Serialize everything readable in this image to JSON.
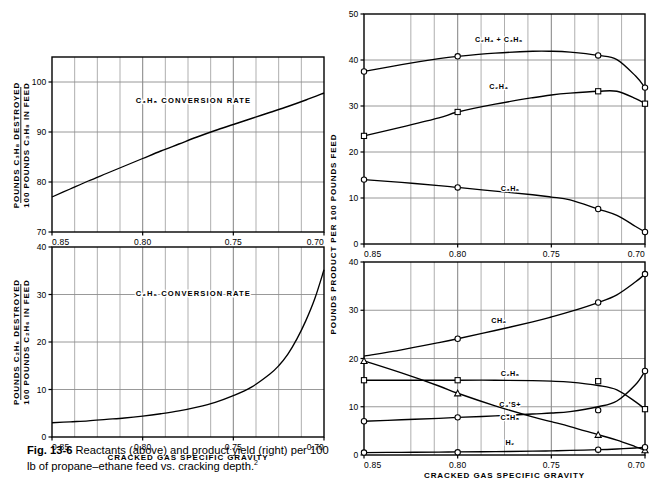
{
  "figure": {
    "caption_label": "Fig. 13-6",
    "caption_text": "Reactants (above) and product yield (right) per 100 lb of propane–ethane feed vs. cracking depth.",
    "caption_footnote_marker": "2",
    "xlabel": "CRACKED GAS SPECIFIC GRAVITY",
    "left_ylabel_line1": "POUNDS C₃H₈ DESTROYED",
    "left_ylabel_line2": "100 POUNDS C₃H₈ IN FEED",
    "left_ylabel2_line1": "POUNDS C₂H₆ DESTROYED",
    "left_ylabel2_line2": "100 POUNDS C₂H₆ IN FEED",
    "right_ylabel": "POUNDS PRODUCT PER 100 POUNDS FEED",
    "line_color": "#000000",
    "grid_color": "#8d8d8d",
    "background": "#ffffff"
  },
  "chart_data": [
    {
      "id": "propane-conversion",
      "type": "line",
      "title": "C₃H₈ CONVERSION RATE",
      "xlabel": "",
      "ylabel": "POUNDS C₃H₈ DESTROYED / 100 POUNDS C₃H₈ IN FEED",
      "xlim": [
        0.85,
        0.7
      ],
      "ylim": [
        70,
        105
      ],
      "xticks": [
        0.85,
        0.8,
        0.75,
        0.7
      ],
      "xticklabels": [
        "0.85",
        "0.80",
        "0.75",
        "0.70"
      ],
      "yticks": [
        70,
        80,
        90,
        100
      ],
      "yticklabels": [
        "70",
        "80",
        "90",
        "100"
      ],
      "xgrid_minor": [
        0.8375,
        0.825,
        0.8125,
        0.7875,
        0.775,
        0.7625,
        0.7375,
        0.725,
        0.7125
      ],
      "grid": true,
      "legend": "none",
      "x": [
        0.85,
        0.84,
        0.83,
        0.82,
        0.81,
        0.8,
        0.79,
        0.78,
        0.77,
        0.76,
        0.75,
        0.74,
        0.73,
        0.72,
        0.71,
        0.7
      ],
      "values": [
        77.0,
        78.6,
        80.2,
        81.7,
        83.2,
        84.7,
        86.2,
        87.6,
        89.0,
        90.3,
        91.5,
        92.7,
        93.9,
        95.1,
        96.4,
        97.8
      ]
    },
    {
      "id": "ethane-conversion",
      "type": "line",
      "title": "C₂H₆ CONVERSION RATE",
      "xlabel": "CRACKED GAS SPECIFIC GRAVITY",
      "ylabel": "POUNDS C₂H₆ DESTROYED / 100 POUNDS C₂H₆ IN FEED",
      "xlim": [
        0.85,
        0.7
      ],
      "ylim": [
        0,
        40
      ],
      "xticks": [
        0.85,
        0.8,
        0.75,
        0.7
      ],
      "xticklabels": [
        "0.85",
        "0.80",
        "0.75",
        "0.70"
      ],
      "yticks": [
        0,
        10,
        20,
        30,
        40
      ],
      "yticklabels": [
        "0",
        "10",
        "20",
        "30",
        "40"
      ],
      "xgrid_minor": [
        0.8375,
        0.825,
        0.8125,
        0.7875,
        0.775,
        0.7625,
        0.7375,
        0.725,
        0.7125
      ],
      "grid": true,
      "legend": "none",
      "x": [
        0.85,
        0.84,
        0.83,
        0.82,
        0.81,
        0.8,
        0.79,
        0.78,
        0.77,
        0.76,
        0.75,
        0.74,
        0.73,
        0.725,
        0.72,
        0.715,
        0.71,
        0.705,
        0.7
      ],
      "values": [
        3.0,
        3.2,
        3.4,
        3.7,
        4.0,
        4.4,
        4.9,
        5.5,
        6.3,
        7.3,
        8.7,
        10.5,
        13.2,
        15.0,
        17.4,
        20.6,
        24.5,
        29.2,
        35.2
      ]
    },
    {
      "id": "olefin-yield",
      "type": "line",
      "title": "",
      "xlabel": "",
      "ylabel": "POUNDS PRODUCT PER 100 POUNDS FEED",
      "xlim": [
        0.85,
        0.7
      ],
      "ylim": [
        0,
        50
      ],
      "xticks": [
        0.85,
        0.8,
        0.75,
        0.7
      ],
      "xticklabels": [
        "0.85",
        "0.80",
        "0.75",
        "0.70"
      ],
      "yticks": [
        0,
        10,
        20,
        30,
        40,
        50
      ],
      "yticklabels": [
        "0",
        "10",
        "20",
        "30",
        "40",
        "50"
      ],
      "xgrid_minor": [
        0.825,
        0.8125,
        0.7875,
        0.775,
        0.7625,
        0.7375,
        0.725,
        0.7125
      ],
      "grid": true,
      "legend": "inline-labels",
      "series": [
        {
          "name": "C₂H₄ + C₃H₆",
          "label_x": 0.778,
          "label_y": 44.0,
          "marker": "circle",
          "x": [
            0.85,
            0.83,
            0.81,
            0.8,
            0.78,
            0.76,
            0.75,
            0.74,
            0.725,
            0.715,
            0.705,
            0.7
          ],
          "values": [
            37.5,
            39.0,
            40.3,
            40.8,
            41.5,
            41.9,
            41.9,
            41.7,
            41.0,
            40.1,
            36.5,
            34.0
          ],
          "marker_x": [
            0.85,
            0.8,
            0.725,
            0.7
          ],
          "marker_y": [
            37.5,
            40.8,
            41.0,
            34.0
          ]
        },
        {
          "name": "C₂H₄",
          "label_x": 0.778,
          "label_y": 33.8,
          "marker": "square",
          "x": [
            0.85,
            0.83,
            0.81,
            0.8,
            0.78,
            0.76,
            0.75,
            0.74,
            0.725,
            0.715,
            0.705,
            0.7
          ],
          "values": [
            23.5,
            25.4,
            27.4,
            28.7,
            30.4,
            31.8,
            32.4,
            32.8,
            33.2,
            33.2,
            31.6,
            30.5
          ],
          "marker_x": [
            0.85,
            0.8,
            0.725,
            0.7
          ],
          "marker_y": [
            23.5,
            28.7,
            33.2,
            30.5
          ]
        },
        {
          "name": "C₃H₆",
          "label_x": 0.772,
          "label_y": 11.6,
          "marker": "circle",
          "x": [
            0.85,
            0.83,
            0.81,
            0.8,
            0.78,
            0.76,
            0.75,
            0.74,
            0.725,
            0.715,
            0.705,
            0.7
          ],
          "values": [
            14.0,
            13.4,
            12.7,
            12.3,
            11.5,
            10.7,
            10.2,
            9.6,
            7.6,
            6.2,
            3.8,
            2.6
          ],
          "marker_x": [
            0.85,
            0.8,
            0.725,
            0.7
          ],
          "marker_y": [
            14.0,
            12.3,
            7.6,
            2.6
          ]
        }
      ]
    },
    {
      "id": "product-yield",
      "type": "line",
      "title": "",
      "xlabel": "CRACKED GAS SPECIFIC GRAVITY",
      "ylabel": "POUNDS PRODUCT PER 100 POUNDS FEED",
      "xlim": [
        0.85,
        0.7
      ],
      "ylim": [
        0,
        40
      ],
      "xticks": [
        0.85,
        0.8,
        0.75,
        0.7
      ],
      "xticklabels": [
        "0.85",
        "0.80",
        "0.75",
        "0.70"
      ],
      "yticks": [
        0,
        10,
        20,
        30,
        40
      ],
      "yticklabels": [
        "0",
        "10",
        "20",
        "30",
        "40"
      ],
      "xgrid_minor": [
        0.825,
        0.8125,
        0.7875,
        0.775,
        0.7625,
        0.7375,
        0.725,
        0.7125
      ],
      "grid": true,
      "legend": "inline-labels",
      "series": [
        {
          "name": "CH₄",
          "label_x": 0.778,
          "label_y": 27.4,
          "marker": "circle",
          "x": [
            0.85,
            0.83,
            0.81,
            0.8,
            0.78,
            0.76,
            0.75,
            0.74,
            0.725,
            0.715,
            0.705,
            0.7
          ],
          "values": [
            20.5,
            21.8,
            23.3,
            24.1,
            25.8,
            27.6,
            28.6,
            29.7,
            31.6,
            33.2,
            35.9,
            37.5
          ],
          "marker_x": [
            0.8,
            0.725,
            0.7
          ],
          "marker_y": [
            24.1,
            31.6,
            37.5
          ]
        },
        {
          "name": "C₂H₆",
          "label_x": 0.772,
          "label_y": 16.4,
          "marker": "square",
          "x": [
            0.85,
            0.83,
            0.81,
            0.8,
            0.78,
            0.76,
            0.75,
            0.74,
            0.725,
            0.715,
            0.705,
            0.7
          ],
          "values": [
            15.5,
            15.5,
            15.5,
            15.5,
            15.5,
            15.4,
            15.3,
            15.1,
            14.4,
            13.5,
            11.0,
            9.5
          ],
          "marker_x": [
            0.85,
            0.8,
            0.725,
            0.7
          ],
          "marker_y": [
            15.5,
            15.5,
            15.3,
            9.5
          ]
        },
        {
          "name": "C₄'S+",
          "label_x": 0.772,
          "label_y": 9.9,
          "marker": "circle",
          "x": [
            0.85,
            0.83,
            0.81,
            0.8,
            0.78,
            0.76,
            0.75,
            0.74,
            0.725,
            0.715,
            0.705,
            0.7
          ],
          "values": [
            7.0,
            7.3,
            7.6,
            7.8,
            8.1,
            8.5,
            8.7,
            9.0,
            10.0,
            11.2,
            14.6,
            17.4
          ],
          "marker_x": [
            0.85,
            0.8,
            0.725,
            0.7
          ],
          "marker_y": [
            7.0,
            7.8,
            9.3,
            17.4
          ]
        },
        {
          "name": "C₃H₈",
          "label_x": 0.772,
          "label_y": 7.2,
          "marker": "triangle",
          "x": [
            0.85,
            0.83,
            0.81,
            0.8,
            0.78,
            0.76,
            0.75,
            0.74,
            0.725,
            0.715,
            0.705,
            0.7
          ],
          "values": [
            19.5,
            17.0,
            14.3,
            12.8,
            10.2,
            7.9,
            6.9,
            5.9,
            4.2,
            3.1,
            1.7,
            1.0
          ],
          "marker_x": [
            0.85,
            0.8,
            0.725,
            0.7
          ],
          "marker_y": [
            19.5,
            12.8,
            4.2,
            1.0
          ]
        },
        {
          "name": "H₂",
          "label_x": 0.772,
          "label_y": 2.1,
          "marker": "circle",
          "x": [
            0.85,
            0.83,
            0.81,
            0.8,
            0.78,
            0.76,
            0.75,
            0.74,
            0.725,
            0.715,
            0.705,
            0.7
          ],
          "values": [
            0.5,
            0.55,
            0.6,
            0.65,
            0.7,
            0.8,
            0.85,
            0.95,
            1.1,
            1.25,
            1.45,
            1.6
          ],
          "marker_x": [
            0.85,
            0.8,
            0.725,
            0.7
          ],
          "marker_y": [
            0.5,
            0.55,
            1.1,
            1.6
          ]
        }
      ]
    }
  ]
}
